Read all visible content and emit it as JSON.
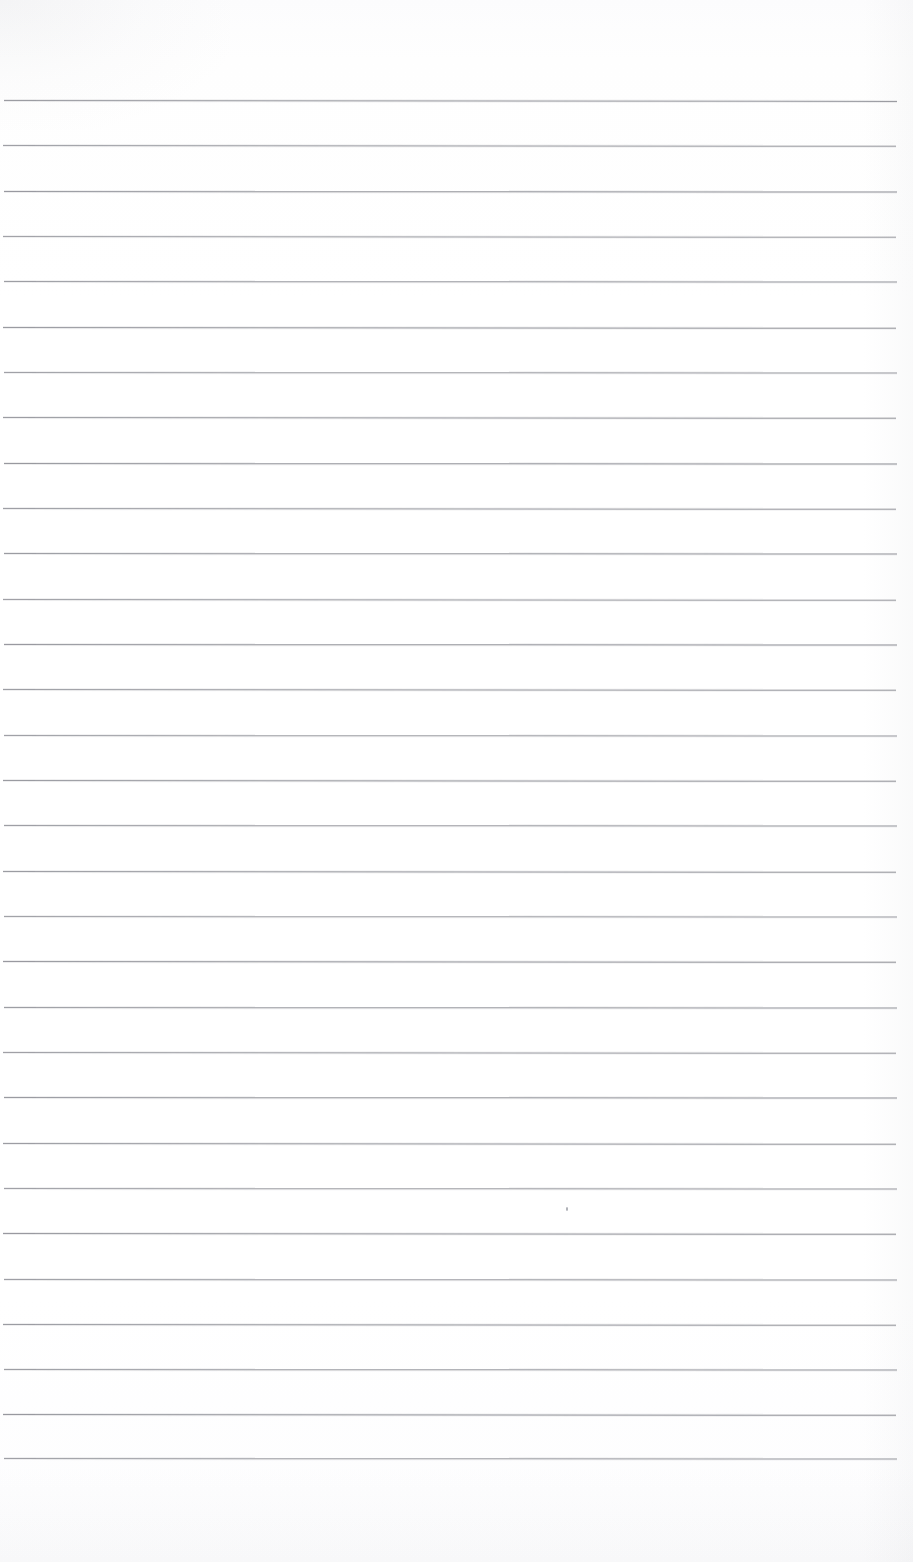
{
  "document": {
    "kind": "scanned-ruled-notebook-page",
    "title": "Blank Ruled Notebook Page",
    "visible_text": "",
    "page_width": 913,
    "page_height": 1562,
    "background_color": "#ffffff",
    "paper_tint_color": "#fcfcfd",
    "has_handwriting": false,
    "has_printed_text": false,
    "has_header": false,
    "has_page_number": false,
    "has_margin_rule": false
  },
  "ruling": {
    "line_color": "#8e9097",
    "line_thickness_px": 1,
    "line_count": 31,
    "spacing_px": 45.2,
    "first_line_y": 100,
    "last_line_y": 1458,
    "left_x": 3,
    "right_x": 897,
    "top_margin_px": 100,
    "bottom_margin_px": 104,
    "lines": [
      {
        "y": 100,
        "x1": 4,
        "x2": 897,
        "tilt_deg": 0.06,
        "opacity": 0.88
      },
      {
        "y": 145,
        "x1": 3,
        "x2": 896,
        "tilt_deg": 0.05,
        "opacity": 0.84
      },
      {
        "y": 191,
        "x1": 4,
        "x2": 897,
        "tilt_deg": 0.04,
        "opacity": 0.9
      },
      {
        "y": 236,
        "x1": 3,
        "x2": 896,
        "tilt_deg": 0.05,
        "opacity": 0.82
      },
      {
        "y": 281,
        "x1": 4,
        "x2": 897,
        "tilt_deg": 0.04,
        "opacity": 0.86
      },
      {
        "y": 327,
        "x1": 3,
        "x2": 896,
        "tilt_deg": 0.05,
        "opacity": 0.89
      },
      {
        "y": 372,
        "x1": 4,
        "x2": 897,
        "tilt_deg": 0.03,
        "opacity": 0.83
      },
      {
        "y": 417,
        "x1": 3,
        "x2": 896,
        "tilt_deg": 0.05,
        "opacity": 0.87
      },
      {
        "y": 463,
        "x1": 4,
        "x2": 897,
        "tilt_deg": 0.04,
        "opacity": 0.91
      },
      {
        "y": 508,
        "x1": 3,
        "x2": 896,
        "tilt_deg": 0.05,
        "opacity": 0.85
      },
      {
        "y": 553,
        "x1": 4,
        "x2": 897,
        "tilt_deg": 0.03,
        "opacity": 0.88
      },
      {
        "y": 599,
        "x1": 3,
        "x2": 896,
        "tilt_deg": 0.05,
        "opacity": 0.84
      },
      {
        "y": 644,
        "x1": 4,
        "x2": 897,
        "tilt_deg": 0.04,
        "opacity": 0.9
      },
      {
        "y": 689,
        "x1": 3,
        "x2": 896,
        "tilt_deg": 0.05,
        "opacity": 0.86
      },
      {
        "y": 735,
        "x1": 4,
        "x2": 897,
        "tilt_deg": 0.03,
        "opacity": 0.83
      },
      {
        "y": 780,
        "x1": 3,
        "x2": 896,
        "tilt_deg": 0.05,
        "opacity": 0.89
      },
      {
        "y": 825,
        "x1": 4,
        "x2": 897,
        "tilt_deg": 0.04,
        "opacity": 0.85
      },
      {
        "y": 871,
        "x1": 3,
        "x2": 896,
        "tilt_deg": 0.05,
        "opacity": 0.88
      },
      {
        "y": 916,
        "x1": 4,
        "x2": 897,
        "tilt_deg": 0.03,
        "opacity": 0.82
      },
      {
        "y": 961,
        "x1": 3,
        "x2": 896,
        "tilt_deg": 0.05,
        "opacity": 0.9
      },
      {
        "y": 1007,
        "x1": 4,
        "x2": 897,
        "tilt_deg": 0.04,
        "opacity": 0.86
      },
      {
        "y": 1052,
        "x1": 3,
        "x2": 896,
        "tilt_deg": 0.05,
        "opacity": 0.84
      },
      {
        "y": 1097,
        "x1": 4,
        "x2": 897,
        "tilt_deg": 0.03,
        "opacity": 0.89
      },
      {
        "y": 1143,
        "x1": 3,
        "x2": 896,
        "tilt_deg": 0.05,
        "opacity": 0.87
      },
      {
        "y": 1188,
        "x1": 4,
        "x2": 897,
        "tilt_deg": 0.04,
        "opacity": 0.83
      },
      {
        "y": 1233,
        "x1": 3,
        "x2": 896,
        "tilt_deg": 0.05,
        "opacity": 0.9
      },
      {
        "y": 1279,
        "x1": 4,
        "x2": 897,
        "tilt_deg": 0.03,
        "opacity": 0.85
      },
      {
        "y": 1324,
        "x1": 3,
        "x2": 896,
        "tilt_deg": 0.05,
        "opacity": 0.88
      },
      {
        "y": 1369,
        "x1": 4,
        "x2": 897,
        "tilt_deg": 0.04,
        "opacity": 0.86
      },
      {
        "y": 1414,
        "x1": 3,
        "x2": 896,
        "tilt_deg": 0.05,
        "opacity": 0.91
      },
      {
        "y": 1458,
        "x1": 4,
        "x2": 897,
        "tilt_deg": 0.03,
        "opacity": 0.84
      }
    ]
  },
  "artifacts": {
    "specks": [
      {
        "name": "ink-speck",
        "x": 566,
        "y": 1207,
        "w": 2,
        "h": 4,
        "color": "#a9abb1"
      }
    ]
  }
}
